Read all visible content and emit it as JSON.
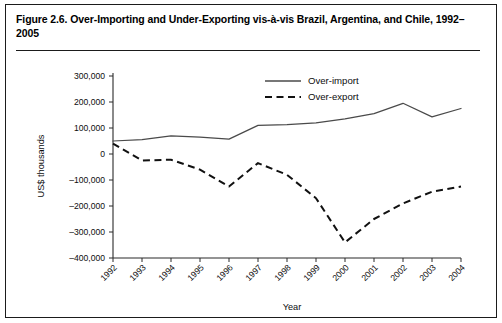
{
  "figure": {
    "caption": "Figure 2.6. Over-Importing and Under-Exporting vis-à-vis Brazil, Argentina, and Chile, 1992–2005"
  },
  "chart_data": {
    "type": "line",
    "title": "Over-Importing and Under-Exporting vis-à-vis Brazil, Argentina, and Chile, 1992–2005",
    "xlabel": "Year",
    "ylabel": "US$ thousands",
    "categories": [
      "1992",
      "1993",
      "1994",
      "1995",
      "1996",
      "1997",
      "1998",
      "1999",
      "2000",
      "2001",
      "2002",
      "2003",
      "2004"
    ],
    "series": [
      {
        "name": "Over-import",
        "style": "solid",
        "color": "#4a4a4a",
        "values": [
          50000,
          55000,
          70000,
          65000,
          57000,
          110000,
          113000,
          120000,
          135000,
          155000,
          195000,
          143000,
          175000
        ]
      },
      {
        "name": "Over-export",
        "style": "dashed",
        "color": "#111111",
        "values": [
          40000,
          -25000,
          -22000,
          -60000,
          -125000,
          -35000,
          -80000,
          -170000,
          -340000,
          -250000,
          -190000,
          -145000,
          -125000
        ]
      }
    ],
    "ylim": [
      -400000,
      300000
    ],
    "yticks": [
      300000,
      200000,
      100000,
      0,
      -100000,
      -200000,
      -300000,
      -400000
    ],
    "ytick_labels": [
      "300,000",
      "200,000",
      "100,000",
      "0",
      "–100,000",
      "–200,000",
      "–300,000",
      "–400,000"
    ],
    "grid": false,
    "legend_position": "top-center",
    "xtick_rotation": 45
  }
}
